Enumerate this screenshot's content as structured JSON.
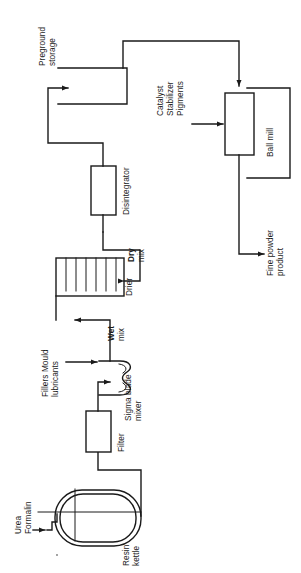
{
  "diagram": {
    "orientation": "rotated-90-ccw",
    "line_color": "#1a1a1a",
    "background_color": "#ffffff"
  },
  "feeds": {
    "urea": "Urea",
    "formalin": "Formalin",
    "additives_line1": "Fillers Mould",
    "additives_line2": "lubricants",
    "ballmill_line1": "Catalyst",
    "ballmill_line2": "Stabilizer",
    "ballmill_line3": "Pigments"
  },
  "units": [
    {
      "id": "resin-kettle",
      "label_line1": "Resin",
      "label_line2": "kettle"
    },
    {
      "id": "filter",
      "label_line1": "Filter",
      "label_line2": ""
    },
    {
      "id": "sigma-blade-mixer",
      "label_line1": "Sigma blade",
      "label_line2": "mixer"
    },
    {
      "id": "drier",
      "label_line1": "Drier",
      "label_line2": ""
    },
    {
      "id": "disintegrator",
      "label_line1": "Disintegrator",
      "label_line2": ""
    },
    {
      "id": "preground-storage",
      "label_line1": "Preground",
      "label_line2": "storage"
    },
    {
      "id": "ball-mill",
      "label_line1": "Ball mill",
      "label_line2": ""
    }
  ],
  "streams": {
    "wet_mix_line1": "Wet",
    "wet_mix_line2": "mix",
    "dry_mix_line1": "Dry",
    "dry_mix_line2": "mix"
  },
  "product": {
    "line1": "Fine powder",
    "line2": "product"
  },
  "drier_segments": 6
}
